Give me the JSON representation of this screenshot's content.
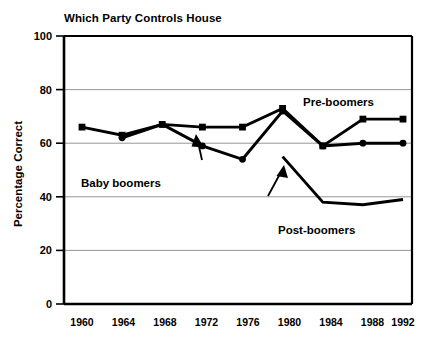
{
  "chart_data": {
    "type": "line",
    "title": "Which Party Controls House",
    "xlabel": "",
    "ylabel": "Percentage Correct",
    "x": [
      1960,
      1964,
      1968,
      1972,
      1976,
      1980,
      1984,
      1988,
      1992
    ],
    "categories": [
      "1960",
      "1964",
      "1968",
      "1972",
      "1976",
      "1980",
      "1984",
      "1988",
      "1992"
    ],
    "ylim": [
      0,
      100
    ],
    "yticks": [
      0,
      20,
      40,
      60,
      80,
      100
    ],
    "ytick_labels": [
      "0",
      "20",
      "40",
      "60",
      "80",
      "100"
    ],
    "xtick_labels": [
      "1960",
      "1964",
      "1968",
      "1972",
      "1976",
      "1980",
      "1984",
      "1988",
      "1992"
    ],
    "grid": "horizontal",
    "legend": "inline-annotations",
    "series": [
      {
        "name": "Pre-boomers",
        "marker": "square",
        "values": [
          66,
          63,
          67,
          66,
          66,
          73,
          59,
          69,
          69
        ]
      },
      {
        "name": "Baby boomers",
        "marker": "circle",
        "values": [
          null,
          62,
          67,
          59,
          54,
          72,
          59,
          60,
          60
        ]
      },
      {
        "name": "Post-boomers",
        "marker": "none",
        "values": [
          null,
          null,
          null,
          null,
          null,
          55,
          38,
          37,
          39
        ]
      }
    ],
    "annotations": [
      {
        "text": "Pre-boomers",
        "x": 1984,
        "y": 79
      },
      {
        "text": "Baby boomers",
        "x": 1964,
        "y": 45
      },
      {
        "text": "Post-boomers",
        "x": 1984,
        "y": 28
      }
    ]
  }
}
